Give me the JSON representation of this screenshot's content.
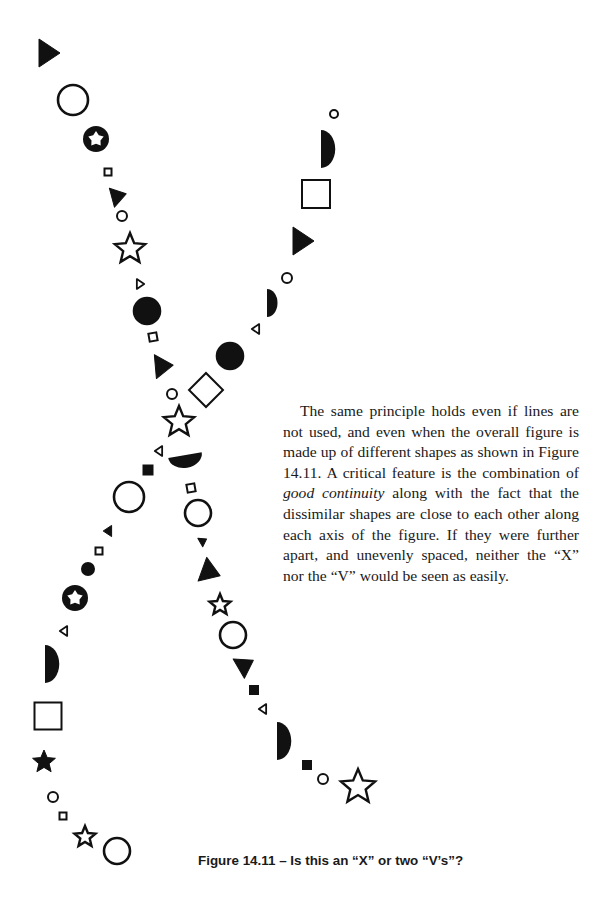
{
  "paragraph": {
    "part1": "The same principle holds even if lines are not used, and even when the overall figure is made up of different shapes as shown in Figure 14.11. A critical feature is the combination of ",
    "emphasis": "good continuity",
    "part2": " along with the fact that the dissimilar shapes are close to each other along each axis of the figure. If they were further apart, and unevenly spaced, neither the “X” nor the “V” would be seen as easily."
  },
  "caption": "Figure 14.11 – Is this an “X” or two “V’s”?",
  "figure": {
    "ink_color": "#111111",
    "shapes": [
      {
        "type": "triangle",
        "fill": true,
        "x": 48,
        "y": 53,
        "size": 20,
        "rot": 0
      },
      {
        "type": "circle",
        "fill": false,
        "x": 73,
        "y": 100,
        "r": 15
      },
      {
        "type": "star-in-circle",
        "x": 96,
        "y": 139,
        "r": 13
      },
      {
        "type": "square",
        "fill": false,
        "x": 108,
        "y": 172,
        "size": 7,
        "rot": 0
      },
      {
        "type": "triangle",
        "fill": true,
        "x": 118,
        "y": 196,
        "size": 14,
        "rot": -15
      },
      {
        "type": "circle",
        "fill": false,
        "x": 122,
        "y": 216,
        "r": 5
      },
      {
        "type": "star",
        "fill": false,
        "x": 130,
        "y": 249,
        "r": 16
      },
      {
        "type": "triangle",
        "fill": false,
        "x": 140,
        "y": 284,
        "size": 7,
        "rot": 0
      },
      {
        "type": "circle",
        "fill": true,
        "x": 147,
        "y": 311,
        "r": 13
      },
      {
        "type": "square",
        "fill": false,
        "x": 153,
        "y": 337,
        "size": 8,
        "rot": -10
      },
      {
        "type": "triangle",
        "fill": true,
        "x": 163,
        "y": 366,
        "size": 17,
        "rot": -5
      },
      {
        "type": "circle",
        "fill": false,
        "x": 172,
        "y": 394,
        "r": 5
      },
      {
        "type": "star",
        "fill": false,
        "x": 179,
        "y": 422,
        "r": 16
      },
      {
        "type": "half-circle",
        "fill": true,
        "x": 186,
        "y": 461,
        "r": 17,
        "rot": -10,
        "orient": "down"
      },
      {
        "type": "square",
        "fill": false,
        "x": 191,
        "y": 488,
        "size": 8,
        "rot": -10
      },
      {
        "type": "circle",
        "fill": false,
        "x": 198,
        "y": 513,
        "r": 13
      },
      {
        "type": "triangle",
        "fill": true,
        "x": 203,
        "y": 541,
        "size": 7,
        "rot": -30
      },
      {
        "type": "triangle",
        "fill": true,
        "x": 210,
        "y": 572,
        "size": 18,
        "rot": 20
      },
      {
        "type": "star",
        "fill": false,
        "x": 220,
        "y": 605,
        "r": 11
      },
      {
        "type": "circle",
        "fill": false,
        "x": 233,
        "y": 635,
        "r": 13
      },
      {
        "type": "triangle",
        "fill": true,
        "x": 245,
        "y": 665,
        "size": 16,
        "rot": -30
      },
      {
        "type": "square",
        "fill": true,
        "x": 254,
        "y": 690,
        "size": 8,
        "rot": 0
      },
      {
        "type": "triangle",
        "fill": false,
        "x": 263,
        "y": 709,
        "size": 7,
        "rot": 180
      },
      {
        "type": "half-circle",
        "fill": true,
        "x": 277,
        "y": 741,
        "r": 19,
        "rot": 0,
        "orient": "right"
      },
      {
        "type": "square",
        "fill": true,
        "x": 307,
        "y": 765,
        "size": 8,
        "rot": 0
      },
      {
        "type": "circle",
        "fill": false,
        "x": 323,
        "y": 779,
        "r": 5
      },
      {
        "type": "star",
        "fill": false,
        "x": 358,
        "y": 787,
        "r": 18
      },
      {
        "type": "circle",
        "fill": false,
        "x": 334,
        "y": 114,
        "r": 4
      },
      {
        "type": "half-circle",
        "fill": true,
        "x": 321,
        "y": 149,
        "r": 19,
        "rot": 0,
        "orient": "right"
      },
      {
        "type": "square",
        "fill": false,
        "x": 316,
        "y": 194,
        "size": 28,
        "rot": 0
      },
      {
        "type": "triangle",
        "fill": true,
        "x": 302,
        "y": 241,
        "size": 20,
        "rot": 0
      },
      {
        "type": "circle",
        "fill": false,
        "x": 287,
        "y": 278,
        "r": 5
      },
      {
        "type": "half-circle",
        "fill": true,
        "x": 267,
        "y": 303,
        "r": 14,
        "rot": 0,
        "orient": "right"
      },
      {
        "type": "triangle",
        "fill": false,
        "x": 256,
        "y": 329,
        "size": 7,
        "rot": 180
      },
      {
        "type": "circle",
        "fill": true,
        "x": 230,
        "y": 356,
        "r": 13
      },
      {
        "type": "square",
        "fill": false,
        "x": 206,
        "y": 390,
        "size": 24,
        "rot": 45
      },
      {
        "type": "triangle",
        "fill": false,
        "x": 159,
        "y": 451,
        "size": 7,
        "rot": 180
      },
      {
        "type": "square",
        "fill": true,
        "x": 148,
        "y": 470,
        "size": 9,
        "rot": 0
      },
      {
        "type": "circle",
        "fill": false,
        "x": 129,
        "y": 497,
        "r": 15
      },
      {
        "type": "triangle",
        "fill": true,
        "x": 108,
        "y": 531,
        "size": 8,
        "rot": 180
      },
      {
        "type": "square",
        "fill": false,
        "x": 99,
        "y": 551,
        "size": 7,
        "rot": 0
      },
      {
        "type": "circle",
        "fill": true,
        "x": 88,
        "y": 569,
        "r": 6
      },
      {
        "type": "star-in-circle",
        "x": 75,
        "y": 598,
        "r": 13
      },
      {
        "type": "triangle",
        "fill": false,
        "x": 64,
        "y": 631,
        "size": 7,
        "rot": 180
      },
      {
        "type": "half-circle",
        "fill": true,
        "x": 45,
        "y": 664,
        "r": 19,
        "rot": 0,
        "orient": "right"
      },
      {
        "type": "square",
        "fill": false,
        "x": 48,
        "y": 716,
        "size": 27,
        "rot": 0
      },
      {
        "type": "star",
        "fill": true,
        "x": 44,
        "y": 762,
        "r": 12
      },
      {
        "type": "circle",
        "fill": false,
        "x": 53,
        "y": 797,
        "r": 5
      },
      {
        "type": "square",
        "fill": false,
        "x": 63,
        "y": 816,
        "size": 7,
        "rot": 0
      },
      {
        "type": "star",
        "fill": false,
        "x": 85,
        "y": 837,
        "r": 11
      },
      {
        "type": "circle",
        "fill": false,
        "x": 117,
        "y": 851,
        "r": 13
      }
    ]
  }
}
